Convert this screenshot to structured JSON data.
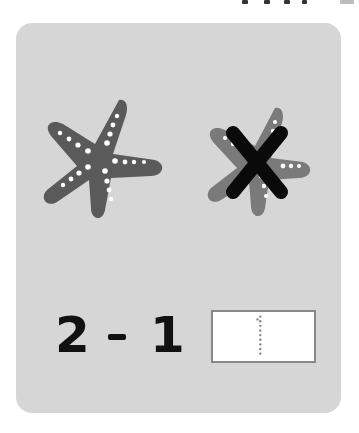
{
  "worksheet": {
    "equation": {
      "minuend": "2",
      "operator": "-",
      "subtrahend": "1",
      "answer_trace": "1"
    },
    "items": [
      {
        "type": "starfish",
        "crossed_out": false
      },
      {
        "type": "starfish",
        "crossed_out": true
      }
    ],
    "colors": {
      "card_bg": "#d6d6d6",
      "starfish": "#5a5a5a",
      "starfish_crossed": "#7a7a7a",
      "cross_mark": "#0a0a0a",
      "dots": "#ffffff"
    }
  }
}
